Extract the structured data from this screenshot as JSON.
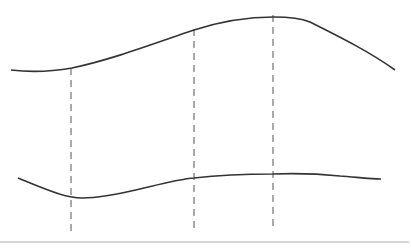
{
  "diagram": {
    "colors": {
      "background": "#ffffff",
      "curve": "#333333",
      "dashed_line": "#555555",
      "baseline": "#c8c8c8"
    },
    "upper_curve": {
      "path": "M 11 70 C 35 73, 55 71, 72 68 C 110 60, 150 45, 194 30 C 225 20, 250 17, 274 17 C 290 17, 300 18, 310 22 C 340 37, 370 52, 395 70"
    },
    "lower_curve": {
      "path": "M 18 178 C 40 187, 60 196, 72 197 C 85 200, 110 196, 140 189 C 165 183, 180 179, 194 178 C 220 175, 250 174, 273 174 C 300 173, 320 174, 340 176 C 355 177, 370 179, 381 179"
    },
    "guides": [
      {
        "x": 71,
        "y1": 68,
        "y2": 231
      },
      {
        "x": 194,
        "y1": 29,
        "y2": 231
      },
      {
        "x": 273,
        "y1": 15,
        "y2": 230
      }
    ],
    "baseline": {
      "x1": 0,
      "x2": 409,
      "y": 242
    }
  }
}
